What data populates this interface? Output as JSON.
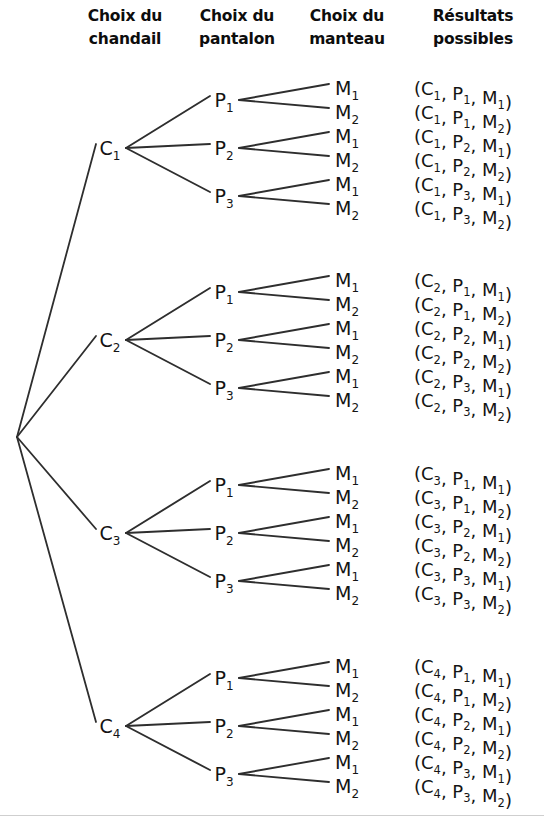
{
  "diagram": {
    "title_columns": [
      {
        "id": "chandail",
        "line1": "Choix du",
        "line2": "chandail",
        "x": 125
      },
      {
        "id": "pantalon",
        "line1": "Choix du",
        "line2": "pantalon",
        "x": 237
      },
      {
        "id": "manteau",
        "line1": "Choix du",
        "line2": "manteau",
        "x": 347
      },
      {
        "id": "resultats",
        "line1": "Résultats",
        "line2": "possibles",
        "x": 473
      }
    ],
    "type": "probability-tree",
    "root": {
      "x": 17,
      "y": 437
    },
    "geometry": {
      "c_label_x": 110,
      "p_label_x": 224,
      "m_label_x": 347,
      "result_x": 414,
      "row_spacing": 24,
      "p_spacing": 48,
      "group_centers": [
        148,
        340,
        533,
        726
      ]
    },
    "line_color": "#2e2e2e",
    "text_color": "#141414",
    "background": "#ffffff",
    "nodes": {
      "level1_prefix": "C",
      "level2_prefix": "P",
      "level3_prefix": "M",
      "level1_count": 4,
      "level2_count": 3,
      "level3_count": 2
    },
    "level1": [
      {
        "base": "C",
        "sub": "1"
      },
      {
        "base": "C",
        "sub": "2"
      },
      {
        "base": "C",
        "sub": "3"
      },
      {
        "base": "C",
        "sub": "4"
      }
    ],
    "level2": [
      {
        "base": "P",
        "sub": "1"
      },
      {
        "base": "P",
        "sub": "2"
      },
      {
        "base": "P",
        "sub": "3"
      }
    ],
    "level3": [
      {
        "base": "M",
        "sub": "1"
      },
      {
        "base": "M",
        "sub": "2"
      }
    ],
    "outcomes": [
      {
        "c": "1",
        "p": "1",
        "m": "1"
      },
      {
        "c": "1",
        "p": "1",
        "m": "2"
      },
      {
        "c": "1",
        "p": "2",
        "m": "1"
      },
      {
        "c": "1",
        "p": "2",
        "m": "2"
      },
      {
        "c": "1",
        "p": "3",
        "m": "1"
      },
      {
        "c": "1",
        "p": "3",
        "m": "2"
      },
      {
        "c": "2",
        "p": "1",
        "m": "1"
      },
      {
        "c": "2",
        "p": "1",
        "m": "2"
      },
      {
        "c": "2",
        "p": "2",
        "m": "1"
      },
      {
        "c": "2",
        "p": "2",
        "m": "2"
      },
      {
        "c": "2",
        "p": "3",
        "m": "1"
      },
      {
        "c": "2",
        "p": "3",
        "m": "2"
      },
      {
        "c": "3",
        "p": "1",
        "m": "1"
      },
      {
        "c": "3",
        "p": "1",
        "m": "2"
      },
      {
        "c": "3",
        "p": "2",
        "m": "1"
      },
      {
        "c": "3",
        "p": "2",
        "m": "2"
      },
      {
        "c": "3",
        "p": "3",
        "m": "1"
      },
      {
        "c": "3",
        "p": "3",
        "m": "2"
      },
      {
        "c": "4",
        "p": "1",
        "m": "1"
      },
      {
        "c": "4",
        "p": "1",
        "m": "2"
      },
      {
        "c": "4",
        "p": "2",
        "m": "1"
      },
      {
        "c": "4",
        "p": "2",
        "m": "2"
      },
      {
        "c": "4",
        "p": "3",
        "m": "1"
      },
      {
        "c": "4",
        "p": "3",
        "m": "2"
      }
    ],
    "outcome_open": "(",
    "outcome_sep": ", ",
    "outcome_close": ")",
    "total_outcomes": 24
  }
}
